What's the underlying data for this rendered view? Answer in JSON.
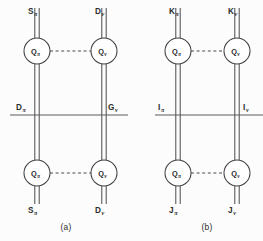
{
  "figure": {
    "width": 263,
    "height": 241,
    "background_color": "#fcfcfc",
    "line_color": "#4a4a4a",
    "node_fill_color": "#ffffff",
    "node_stroke_color": "#3f3f3f"
  },
  "panels": [
    {
      "id": "a",
      "caption": "(a)",
      "nodes": [
        {
          "id": "a-top-left",
          "base": "Q",
          "sub": "π",
          "cx": 37,
          "cy": 51,
          "r": 13
        },
        {
          "id": "a-top-right",
          "base": "Q",
          "sub": "ν",
          "cx": 104,
          "cy": 51,
          "r": 13
        },
        {
          "id": "a-bottom-left",
          "base": "Q",
          "sub": "π",
          "cx": 37,
          "cy": 173,
          "r": 13
        },
        {
          "id": "a-bottom-right",
          "base": "Q",
          "sub": "ν",
          "cx": 104,
          "cy": 173,
          "r": 13
        }
      ],
      "terminal_labels": [
        {
          "id": "a-top-left-term",
          "base": "S",
          "sub": "π",
          "x": 28,
          "y": 14
        },
        {
          "id": "a-top-right-term",
          "base": "D",
          "sub": "ν",
          "x": 95,
          "y": 14
        },
        {
          "id": "a-mid-left-term",
          "base": "D",
          "sub": "π",
          "x": 16,
          "y": 110
        },
        {
          "id": "a-mid-right-term",
          "base": "G",
          "sub": "ν",
          "x": 108,
          "y": 110
        },
        {
          "id": "a-bottom-left-term",
          "base": "S",
          "sub": "π",
          "x": 28,
          "y": 213
        },
        {
          "id": "a-bottom-right-term",
          "base": "D",
          "sub": "ν",
          "x": 95,
          "y": 213
        }
      ],
      "rail": {
        "x1": 10,
        "x2": 128,
        "y": 115
      },
      "dashed_links": [
        {
          "id": "a-dashed-top",
          "x1": 50,
          "x2": 91,
          "y": 51
        },
        {
          "id": "a-dashed-bottom",
          "x1": 50,
          "x2": 91,
          "y": 173
        }
      ]
    },
    {
      "id": "b",
      "caption": "(b)",
      "nodes": [
        {
          "id": "b-top-left",
          "base": "Q",
          "sub": "π",
          "cx": 178,
          "cy": 51,
          "r": 13
        },
        {
          "id": "b-top-right",
          "base": "Q",
          "sub": "ν",
          "cx": 237,
          "cy": 51,
          "r": 13
        },
        {
          "id": "b-bottom-left",
          "base": "Q",
          "sub": "π",
          "cx": 178,
          "cy": 173,
          "r": 13
        },
        {
          "id": "b-bottom-right",
          "base": "Q",
          "sub": "ν",
          "cx": 237,
          "cy": 173,
          "r": 13
        }
      ],
      "terminal_labels": [
        {
          "id": "b-top-left-term",
          "base": "K",
          "sub": "π",
          "x": 169,
          "y": 14
        },
        {
          "id": "b-top-right-term",
          "base": "K",
          "sub": "ν",
          "x": 228,
          "y": 14
        },
        {
          "id": "b-mid-left-term",
          "base": "I",
          "sub": "π",
          "x": 158,
          "y": 110
        },
        {
          "id": "b-mid-right-term",
          "base": "I",
          "sub": "ν",
          "x": 243,
          "y": 110
        },
        {
          "id": "b-bottom-left-term",
          "base": "J",
          "sub": "π",
          "x": 169,
          "y": 213
        },
        {
          "id": "b-bottom-right-term",
          "base": "J",
          "sub": "ν",
          "x": 228,
          "y": 213
        }
      ],
      "rail": {
        "x1": 155,
        "x2": 263,
        "y": 115
      },
      "dashed_links": [
        {
          "id": "b-dashed-top",
          "x1": 191,
          "x2": 224,
          "y": 51
        },
        {
          "id": "b-dashed-bottom",
          "x1": 191,
          "x2": 224,
          "y": 173
        }
      ]
    }
  ],
  "captions": [
    {
      "id": "caption-a",
      "text": "(a)",
      "x": 66,
      "y": 230
    },
    {
      "id": "caption-b",
      "text": "(b)",
      "x": 207,
      "y": 230
    }
  ]
}
